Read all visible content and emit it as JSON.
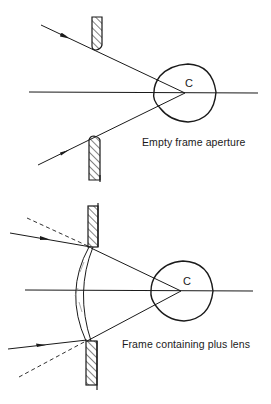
{
  "diagrams": [
    {
      "id": "empty-frame",
      "caption": "Empty frame aperture",
      "center_label": "C",
      "rays": "solid rays pass frame edges and converge at eye center C"
    },
    {
      "id": "plus-lens-frame",
      "caption": "Frame containing plus lens",
      "center_label": "C",
      "rays": "plus lens refracts rays; dashed lines show unrefracted extension"
    }
  ],
  "colors": {
    "line": "#1a1a1a",
    "background": "#ffffff"
  }
}
